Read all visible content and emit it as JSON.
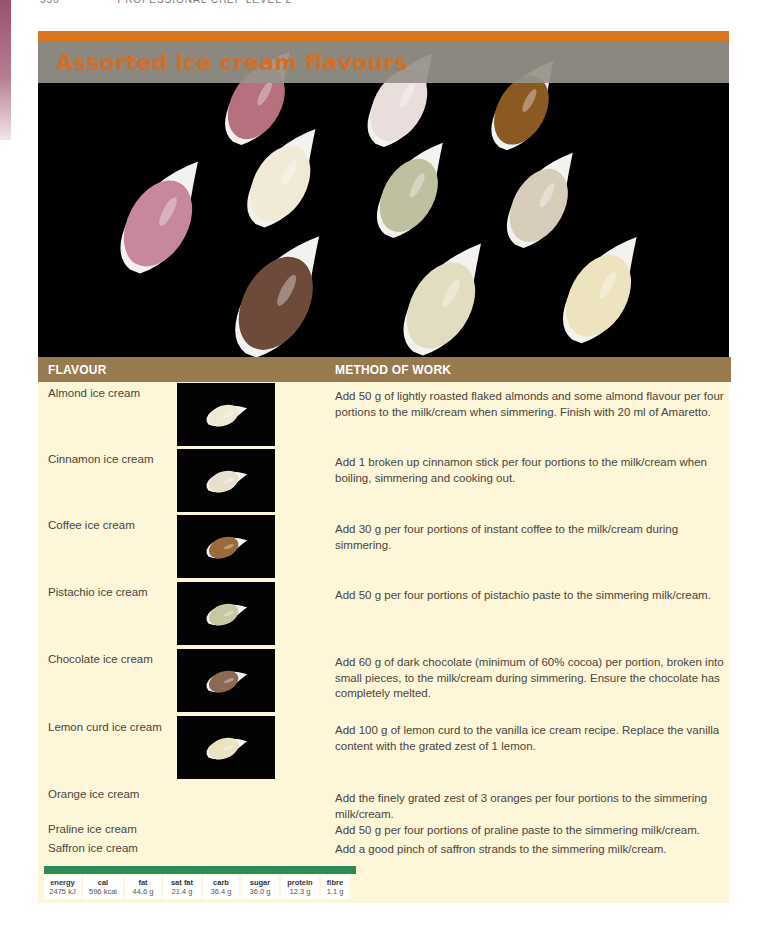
{
  "page": {
    "running_head": {
      "page_number": "556",
      "book_title": "PROFESSIONAL CHEF LEVEL 2"
    }
  },
  "recipe": {
    "title": "Assorted ice cream flavours",
    "colors": {
      "accent_orange": "#d9741f",
      "title_text": "#d16f27",
      "title_bar": "#96928a",
      "table_header": "#977a50",
      "panel_bg": "#fdf6d8",
      "nutrition_bar": "#2e8b57"
    },
    "hero_image": {
      "description": "Eleven scoops of ice cream on white spoons on black background",
      "scoops": [
        {
          "color": "#b6707e",
          "name": "strawberry"
        },
        {
          "color": "#e9dedc",
          "name": "vanilla-pink"
        },
        {
          "color": "#8a5a22",
          "name": "coffee"
        },
        {
          "color": "#c7879d",
          "name": "raspberry"
        },
        {
          "color": "#f0ead7",
          "name": "almond"
        },
        {
          "color": "#bfc0a0",
          "name": "pistachio"
        },
        {
          "color": "#d8ccba",
          "name": "cinnamon"
        },
        {
          "color": "#6d4a3a",
          "name": "chocolate"
        },
        {
          "color": "#e2dcc0",
          "name": "praline"
        },
        {
          "color": "#ede3bf",
          "name": "lemon-curd"
        }
      ]
    }
  },
  "table": {
    "headers": {
      "flavour": "FLAVOUR",
      "method": "METHOD OF WORK"
    },
    "rows": [
      {
        "flavour": "Almond ice cream",
        "method": "Add 50 g of lightly roasted flaked almonds and some almond flavour per four portions to the milk/cream when simmering. Finish with 20 ml of Amaretto.",
        "thumb_color": "#f0ead2"
      },
      {
        "flavour": "Cinnamon ice cream",
        "method": "Add 1 broken up cinnamon stick per four portions to the milk/cream when boiling, simmering and cooking out.",
        "thumb_color": "#e8e0cc"
      },
      {
        "flavour": "Coffee ice cream",
        "method": "Add 30 g per four portions of instant coffee to the milk/cream during simmering.",
        "thumb_color": "#9a6a3a"
      },
      {
        "flavour": "Pistachio ice cream",
        "method": "Add 50 g per four portions of pistachio paste to the simmering milk/cream.",
        "thumb_color": "#c8c8a4"
      },
      {
        "flavour": "Chocolate ice cream",
        "method": "Add 60 g of dark chocolate (minimum of 60% cocoa) per portion, broken into small pieces, to the milk/cream during simmering. Ensure the chocolate has completely melted.",
        "thumb_color": "#8a6a52"
      },
      {
        "flavour": "Lemon curd ice cream",
        "method": "Add 100 g of lemon curd to the vanilla ice cream recipe. Replace the vanilla content with the grated zest of 1 lemon.",
        "thumb_color": "#ece3c0"
      },
      {
        "flavour": "Orange ice cream",
        "method": "Add the finely grated zest of 3 oranges per four portions to the simmering milk/cream."
      },
      {
        "flavour": "Praline ice cream",
        "method": "Add 50 g per four portions of praline paste to the simmering milk/cream."
      },
      {
        "flavour": "Saffron ice cream",
        "method": "Add a good pinch of saffron strands to the simmering milk/cream."
      }
    ]
  },
  "nutrition": [
    {
      "label": "energy",
      "value": "2475 kJ"
    },
    {
      "label": "cal",
      "value": "596 kcal"
    },
    {
      "label": "fat",
      "value": "44.6 g"
    },
    {
      "label": "sat fat",
      "value": "21.4 g"
    },
    {
      "label": "carb",
      "value": "36.4 g"
    },
    {
      "label": "sugar",
      "value": "36.0 g"
    },
    {
      "label": "protein",
      "value": "12.3 g"
    },
    {
      "label": "fibre",
      "value": "1.1 g"
    }
  ]
}
